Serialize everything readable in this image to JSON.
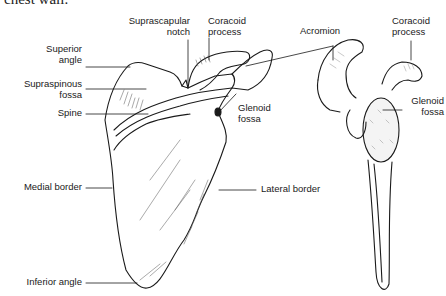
{
  "caption": "chest wall.",
  "diagram": {
    "subject": "Scapula",
    "views": [
      "posterior view",
      "lateral view"
    ],
    "labels": {
      "superior_angle": "Superior\nangle",
      "supraspinous_fossa": "Supraspinous\nfossa",
      "spine": "Spine",
      "medial_border": "Medial border",
      "inferior_angle": "Inferior angle",
      "suprascapular_notch": "Suprascapular\nnotch",
      "coracoid_process_left": "Coracoid\nprocess",
      "glenoid_fossa_left": "Glenoid\nfossa",
      "lateral_border": "Lateral border",
      "acromion": "Acromion",
      "coracoid_process_right": "Coracoid\nprocess",
      "glenoid_fossa_right": "Glenoid\nfossa"
    },
    "colors": {
      "ink": "#1a1a1a",
      "background": "#ffffff"
    }
  }
}
